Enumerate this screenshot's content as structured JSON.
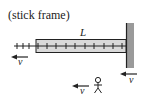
{
  "diagram": {
    "caption": "(stick frame)",
    "rod_label": "L",
    "velocity_labels": {
      "left": "v",
      "wall": "v",
      "observer": "v"
    },
    "colors": {
      "stroke": "#222222",
      "rod_fill": "#d9d9d9",
      "wall_fill": "#9a9a9a",
      "background": "#ffffff"
    },
    "ticks": {
      "outside_count": 3,
      "inside_count": 10
    }
  }
}
